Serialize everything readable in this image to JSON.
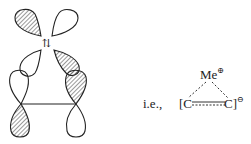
{
  "figure": {
    "orbital_diagram": {
      "description": "orbital interaction diagram: two p-orbitals on metal fragment above, pi orbitals of C-C below",
      "arrow_symbol": "⇅"
    },
    "equivalence": {
      "prefix": "i.e.,",
      "top_atom": "Me",
      "top_charge": "⊕",
      "left_atom": "[C",
      "right_atom": "C]",
      "bracket_charge": "⊖"
    }
  }
}
